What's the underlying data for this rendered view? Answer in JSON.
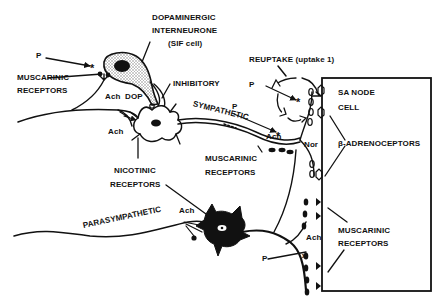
{
  "diagram": {
    "type": "anatomical-schematic",
    "colors": {
      "ink": "#111111",
      "background": "#ffffff",
      "stipple": "#9a9a9a"
    },
    "labels": {
      "dopaminergic_line1": "DOPAMINERGIC",
      "dopaminergic_line2": "INTERNEURONE",
      "sif_cell": "(SIF cell)",
      "p_top_left": "P",
      "muscarinic_top_line1": "MUSCARINIC",
      "muscarinic_top_line2": "RECEPTORS",
      "ach_dop_ach": "Ach",
      "ach_dop_dop": "DOP",
      "inhibitory": "INHIBITORY",
      "ach_ganglion": "Ach",
      "nicotinic_line1": "NICOTINIC",
      "nicotinic_line2": "RECEPTORS",
      "sympathetic": "SYMPATHETIC",
      "p_sympathetic": "P",
      "ach_sympathetic": "Ach",
      "muscarinic_mid_line1": "MUSCARINIC",
      "muscarinic_mid_line2": "RECEPTORS",
      "reuptake": "REUPTAKE (uptake 1)",
      "p_reuptake": "P",
      "nor": "Nor",
      "sa_node_line1": "SA NODE",
      "sa_node_line2": "CELL",
      "beta_adrenoceptors": "β-ADRENOCEPTORS",
      "parasympathetic": "PARASYMPATHETIC",
      "ach_parasympathetic": "Ach",
      "ach_terminal": "Ach",
      "p_bottom": "P",
      "muscarinic_right_line1": "MUSCARINIC",
      "muscarinic_right_line2": "RECEPTORS"
    },
    "nodes": [
      {
        "id": "sif-cell",
        "label": "Dopaminergic interneurone (SIF cell)"
      },
      {
        "id": "sympathetic-ganglion-neuron",
        "label": "Sympathetic ganglion neuron"
      },
      {
        "id": "parasympathetic-ganglion-neuron",
        "label": "Parasympathetic ganglion neuron"
      },
      {
        "id": "sa-node-cell",
        "label": "SA node cell"
      }
    ],
    "edges": [
      {
        "from": "preganglionic-fiber",
        "to": "sif-cell",
        "transmitter": "Ach",
        "receptor": "Muscarinic"
      },
      {
        "from": "sif-cell",
        "to": "sympathetic-ganglion-neuron",
        "transmitter": "DOP",
        "effect": "Inhibitory"
      },
      {
        "from": "preganglionic-fiber",
        "to": "sympathetic-ganglion-neuron",
        "transmitter": "Ach",
        "receptor": "Nicotinic"
      },
      {
        "from": "sympathetic-ganglion-neuron",
        "to": "sa-node-cell",
        "transmitter": "Nor",
        "receptor": "β-adrenoceptors"
      },
      {
        "from": "parasympathetic-preganglionic",
        "to": "parasympathetic-ganglion-neuron",
        "transmitter": "Ach",
        "receptor": "Nicotinic"
      },
      {
        "from": "parasympathetic-ganglion-neuron",
        "to": "sympathetic-terminal",
        "transmitter": "Ach",
        "receptor": "Muscarinic"
      },
      {
        "from": "parasympathetic-ganglion-neuron",
        "to": "sa-node-cell",
        "transmitter": "Ach",
        "receptor": "Muscarinic"
      }
    ]
  }
}
